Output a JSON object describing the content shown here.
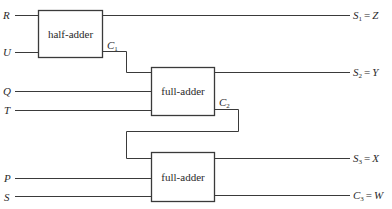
{
  "diagram": {
    "type": "adder-circuit",
    "inputs": [
      {
        "id": "R",
        "label": "R",
        "y": 15
      },
      {
        "id": "U",
        "label": "U",
        "y": 52
      },
      {
        "id": "Q",
        "label": "Q",
        "y": 91
      },
      {
        "id": "T",
        "label": "T",
        "y": 110
      },
      {
        "id": "P",
        "label": "P",
        "y": 178
      },
      {
        "id": "S",
        "label": "S",
        "y": 197
      }
    ],
    "blocks": [
      {
        "id": "ha",
        "label": "half-adder",
        "inputs": [
          "R",
          "U"
        ],
        "outputs": [
          "S1",
          "C1"
        ]
      },
      {
        "id": "fa1",
        "label": "full-adder",
        "inputs": [
          "C1",
          "Q",
          "T"
        ],
        "outputs": [
          "S2",
          "C2"
        ]
      },
      {
        "id": "fa2",
        "label": "full-adder",
        "inputs": [
          "C2",
          "P",
          "S"
        ],
        "outputs": [
          "S3",
          "C3"
        ]
      }
    ],
    "carries": [
      {
        "name": "C",
        "sub": "1"
      },
      {
        "name": "C",
        "sub": "2"
      }
    ],
    "outputs": [
      {
        "name": "S",
        "sub": "1",
        "eq": "=",
        "value": "Z"
      },
      {
        "name": "S",
        "sub": "2",
        "eq": "=",
        "value": "Y"
      },
      {
        "name": "S",
        "sub": "3",
        "eq": "=",
        "value": "X"
      },
      {
        "name": "C",
        "sub": "3",
        "eq": "=",
        "value": "W"
      }
    ]
  }
}
